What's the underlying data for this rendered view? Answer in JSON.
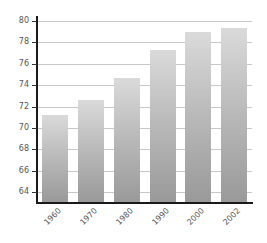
{
  "chart_data": {
    "type": "bar",
    "title": "",
    "xlabel": "",
    "ylabel": "",
    "categories": [
      "1960",
      "1970",
      "1980",
      "1990",
      "2000",
      "2002"
    ],
    "values": [
      71.2,
      72.6,
      74.7,
      77.3,
      79.0,
      79.3
    ],
    "ylim": [
      63,
      80.5
    ],
    "yticks": [
      64,
      66,
      68,
      70,
      72,
      74,
      76,
      78,
      80
    ],
    "ytick_labels": [
      "64",
      "66",
      "68",
      "70",
      "72",
      "74",
      "76",
      "78",
      "80"
    ],
    "grid": true,
    "legend": null,
    "bar_color_top": "#dadada",
    "bar_color_bottom": "#999999"
  }
}
